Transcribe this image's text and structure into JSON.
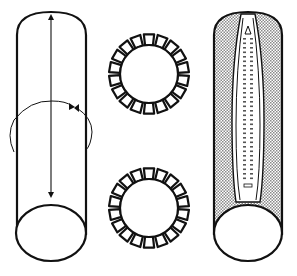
{
  "diagram": {
    "title": "",
    "panels": [
      {
        "id": "tube-with-arrows",
        "description": "Open cylinder with vertical double-headed arrow and curved rotation arrows"
      },
      {
        "id": "gear-rings",
        "description": "Two cross-section rings with rectangular teeth",
        "teeth_count": 18,
        "ring_count": 2
      },
      {
        "id": "tube-with-seam",
        "description": "Shaded cylinder with central zipper-like seam"
      }
    ],
    "colors": {
      "stroke": "#111111",
      "fill": "#ffffff",
      "shade": "#c8c8c8"
    }
  }
}
